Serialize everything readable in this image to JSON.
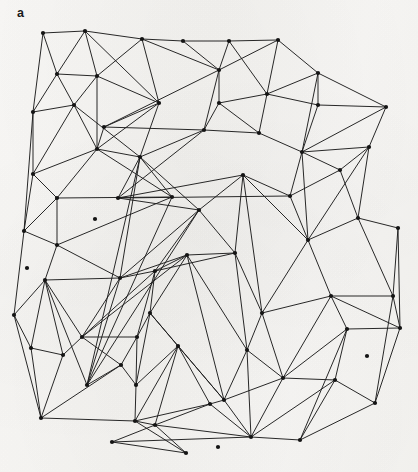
{
  "figure": {
    "panel_label": "a",
    "type": "triangulated planar mesh",
    "background_color": "#f8f7f5",
    "edge_color": "#1c1c1c",
    "vertex_color": "#141414",
    "edge_width": 0.95,
    "vertex_radius": 2.1,
    "canvas": {
      "width": 418,
      "height": 472
    }
  },
  "bleed_through": {
    "visible": true,
    "line_1": "",
    "line_2": ""
  },
  "mesh": {
    "vertex_count": 74,
    "edge_count": 197,
    "vertices": [
      [
        43,
        33
      ],
      [
        85,
        31
      ],
      [
        142,
        39
      ],
      [
        183,
        41
      ],
      [
        229,
        41
      ],
      [
        278,
        40
      ],
      [
        33,
        112
      ],
      [
        57,
        74
      ],
      [
        97,
        76
      ],
      [
        159,
        103
      ],
      [
        219,
        70
      ],
      [
        219,
        103
      ],
      [
        267,
        94
      ],
      [
        318,
        73
      ],
      [
        318,
        105
      ],
      [
        386,
        107
      ],
      [
        74,
        105
      ],
      [
        140,
        157
      ],
      [
        243,
        175
      ],
      [
        302,
        152
      ],
      [
        369,
        147
      ],
      [
        33,
        174
      ],
      [
        97,
        149
      ],
      [
        57,
        245
      ],
      [
        120,
        278
      ],
      [
        24,
        231
      ],
      [
        45,
        280
      ],
      [
        14,
        315
      ],
      [
        57,
        198
      ],
      [
        155,
        271
      ],
      [
        199,
        210
      ],
      [
        187,
        255
      ],
      [
        235,
        253
      ],
      [
        308,
        240
      ],
      [
        358,
        218
      ],
      [
        398,
        228
      ],
      [
        82,
        337
      ],
      [
        137,
        337
      ],
      [
        150,
        313
      ],
      [
        121,
        365
      ],
      [
        136,
        385
      ],
      [
        41,
        418
      ],
      [
        135,
        421
      ],
      [
        155,
        425
      ],
      [
        224,
        400
      ],
      [
        251,
        437
      ],
      [
        283,
        378
      ],
      [
        210,
        404
      ],
      [
        335,
        380
      ],
      [
        375,
        403
      ],
      [
        400,
        328
      ],
      [
        393,
        296
      ],
      [
        178,
        346
      ],
      [
        262,
        313
      ],
      [
        247,
        350
      ],
      [
        95,
        219
      ],
      [
        172,
        197
      ],
      [
        118,
        198
      ],
      [
        87,
        385
      ],
      [
        31,
        348
      ],
      [
        63,
        355
      ],
      [
        27,
        268
      ],
      [
        104,
        127
      ],
      [
        204,
        130
      ],
      [
        259,
        133
      ],
      [
        290,
        196
      ],
      [
        340,
        170
      ],
      [
        331,
        296
      ],
      [
        300,
        440
      ],
      [
        347,
        329
      ],
      [
        186,
        453
      ],
      [
        112,
        442
      ],
      [
        218,
        447
      ],
      [
        367,
        356
      ]
    ],
    "edges": [
      [
        0,
        1
      ],
      [
        1,
        2
      ],
      [
        2,
        3
      ],
      [
        3,
        4
      ],
      [
        4,
        5
      ],
      [
        5,
        13
      ],
      [
        13,
        15
      ],
      [
        15,
        20
      ],
      [
        20,
        34
      ],
      [
        34,
        35
      ],
      [
        35,
        50
      ],
      [
        50,
        51
      ],
      [
        51,
        49
      ],
      [
        49,
        68
      ],
      [
        68,
        45
      ],
      [
        45,
        43
      ],
      [
        43,
        42
      ],
      [
        42,
        41
      ],
      [
        41,
        27
      ],
      [
        27,
        25
      ],
      [
        25,
        6
      ],
      [
        6,
        0
      ],
      [
        0,
        7
      ],
      [
        7,
        1
      ],
      [
        7,
        8
      ],
      [
        8,
        1
      ],
      [
        8,
        2
      ],
      [
        1,
        9
      ],
      [
        9,
        2
      ],
      [
        2,
        10
      ],
      [
        10,
        3
      ],
      [
        10,
        4
      ],
      [
        4,
        12
      ],
      [
        12,
        5
      ],
      [
        5,
        10
      ],
      [
        12,
        13
      ],
      [
        13,
        14
      ],
      [
        14,
        12
      ],
      [
        14,
        15
      ],
      [
        15,
        19
      ],
      [
        19,
        14
      ],
      [
        19,
        13
      ],
      [
        6,
        7
      ],
      [
        6,
        16
      ],
      [
        16,
        7
      ],
      [
        16,
        8
      ],
      [
        16,
        22
      ],
      [
        22,
        8
      ],
      [
        22,
        9
      ],
      [
        9,
        8
      ],
      [
        9,
        62
      ],
      [
        62,
        22
      ],
      [
        62,
        10
      ],
      [
        62,
        63
      ],
      [
        63,
        10
      ],
      [
        63,
        11
      ],
      [
        11,
        10
      ],
      [
        11,
        12
      ],
      [
        11,
        64
      ],
      [
        64,
        12
      ],
      [
        64,
        19
      ],
      [
        63,
        64
      ],
      [
        9,
        17
      ],
      [
        17,
        22
      ],
      [
        17,
        63
      ],
      [
        17,
        57
      ],
      [
        57,
        63
      ],
      [
        57,
        65
      ],
      [
        65,
        19
      ],
      [
        65,
        66
      ],
      [
        66,
        19
      ],
      [
        66,
        20
      ],
      [
        66,
        34
      ],
      [
        20,
        33
      ],
      [
        33,
        34
      ],
      [
        33,
        19
      ],
      [
        33,
        65
      ],
      [
        65,
        18
      ],
      [
        18,
        57
      ],
      [
        18,
        30
      ],
      [
        30,
        57
      ],
      [
        30,
        17
      ],
      [
        6,
        21
      ],
      [
        21,
        16
      ],
      [
        21,
        22
      ],
      [
        21,
        28
      ],
      [
        28,
        22
      ],
      [
        28,
        56
      ],
      [
        56,
        22
      ],
      [
        56,
        17
      ],
      [
        56,
        58
      ],
      [
        58,
        17
      ],
      [
        58,
        30
      ],
      [
        58,
        24
      ],
      [
        24,
        30
      ],
      [
        24,
        17
      ],
      [
        21,
        25
      ],
      [
        25,
        28
      ],
      [
        25,
        23
      ],
      [
        23,
        28
      ],
      [
        23,
        56
      ],
      [
        23,
        24
      ],
      [
        23,
        26
      ],
      [
        26,
        24
      ],
      [
        26,
        27
      ],
      [
        27,
        26
      ],
      [
        26,
        36
      ],
      [
        36,
        24
      ],
      [
        24,
        29
      ],
      [
        29,
        30
      ],
      [
        29,
        31
      ],
      [
        31,
        24
      ],
      [
        31,
        29
      ],
      [
        29,
        32
      ],
      [
        32,
        30
      ],
      [
        32,
        18
      ],
      [
        32,
        31
      ],
      [
        18,
        33
      ],
      [
        18,
        53
      ],
      [
        53,
        32
      ],
      [
        53,
        33
      ],
      [
        53,
        67
      ],
      [
        67,
        33
      ],
      [
        67,
        51
      ],
      [
        67,
        50
      ],
      [
        67,
        69
      ],
      [
        69,
        50
      ],
      [
        69,
        68
      ],
      [
        69,
        46
      ],
      [
        46,
        67
      ],
      [
        46,
        53
      ],
      [
        46,
        54
      ],
      [
        54,
        53
      ],
      [
        54,
        32
      ],
      [
        54,
        31
      ],
      [
        54,
        44
      ],
      [
        44,
        31
      ],
      [
        44,
        38
      ],
      [
        38,
        31
      ],
      [
        38,
        29
      ],
      [
        38,
        37
      ],
      [
        37,
        29
      ],
      [
        37,
        36
      ],
      [
        36,
        29
      ],
      [
        36,
        37
      ],
      [
        36,
        39
      ],
      [
        39,
        37
      ],
      [
        39,
        40
      ],
      [
        40,
        37
      ],
      [
        40,
        38
      ],
      [
        40,
        52
      ],
      [
        52,
        38
      ],
      [
        52,
        44
      ],
      [
        52,
        40
      ],
      [
        26,
        60
      ],
      [
        60,
        36
      ],
      [
        60,
        59
      ],
      [
        59,
        26
      ],
      [
        59,
        27
      ],
      [
        59,
        41
      ],
      [
        60,
        41
      ],
      [
        39,
        41
      ],
      [
        39,
        58
      ],
      [
        58,
        26
      ],
      [
        41,
        42
      ],
      [
        42,
        40
      ],
      [
        42,
        52
      ],
      [
        42,
        47
      ],
      [
        47,
        52
      ],
      [
        47,
        44
      ],
      [
        47,
        43
      ],
      [
        43,
        47
      ],
      [
        44,
        45
      ],
      [
        45,
        47
      ],
      [
        45,
        54
      ],
      [
        45,
        46
      ],
      [
        46,
        48
      ],
      [
        48,
        45
      ],
      [
        48,
        68
      ],
      [
        48,
        49
      ],
      [
        48,
        69
      ],
      [
        49,
        50
      ],
      [
        34,
        51
      ],
      [
        34,
        33
      ],
      [
        35,
        51
      ],
      [
        15,
        19
      ],
      [
        20,
        19
      ],
      [
        5,
        12
      ],
      [
        3,
        10
      ],
      [
        16,
        17
      ],
      [
        11,
        63
      ],
      [
        66,
        65
      ],
      [
        44,
        46
      ],
      [
        52,
        43
      ],
      [
        40,
        39
      ],
      [
        31,
        36
      ],
      [
        30,
        18
      ],
      [
        28,
        21
      ],
      [
        29,
        24
      ],
      [
        70,
        42
      ],
      [
        70,
        43
      ],
      [
        70,
        71
      ],
      [
        71,
        43
      ],
      [
        71,
        45
      ],
      [
        59,
        60
      ]
    ]
  }
}
